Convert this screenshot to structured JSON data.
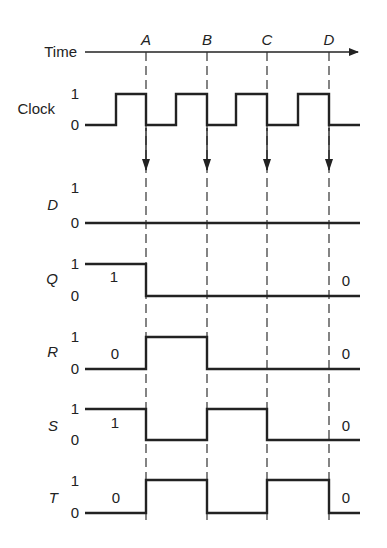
{
  "diagram": {
    "time_axis": {
      "label": "Time",
      "markers": [
        "A",
        "B",
        "C",
        "D"
      ]
    },
    "signals": [
      {
        "name": "Clock",
        "high_label": "1",
        "low_label": "0",
        "italic": false,
        "points": "85,125 116,125 116,94 146,94 146,125 176,125 176,94 207,94 207,125 236,125 236,94 267,94 267,125 298,125 298,94 329,94 329,125 360,125"
      },
      {
        "name": "D",
        "high_label": "1",
        "low_label": "0",
        "italic": true,
        "points": "85,223 360,223"
      },
      {
        "name": "Q",
        "high_label": "1",
        "low_label": "0",
        "italic": true,
        "start_value": "1",
        "end_value": "0",
        "points": "85,264 146,264 146,296 360,296"
      },
      {
        "name": "R",
        "high_label": "1",
        "low_label": "0",
        "italic": true,
        "start_value": "0",
        "end_value": "0",
        "points": "85,369 146,369 146,337 207,337 207,369 360,369"
      },
      {
        "name": "S",
        "high_label": "1",
        "low_label": "0",
        "italic": true,
        "start_value": "1",
        "end_value": "0",
        "points": "85,409 146,409 146,440 207,440 207,409 267,409 267,440 360,440"
      },
      {
        "name": "T",
        "high_label": "1",
        "low_label": "0",
        "italic": true,
        "start_value": "0",
        "end_value": "0",
        "points": "85,513 146,513 146,480 207,480 207,513 267,513 267,480 329,480 329,513 360,513"
      }
    ]
  }
}
